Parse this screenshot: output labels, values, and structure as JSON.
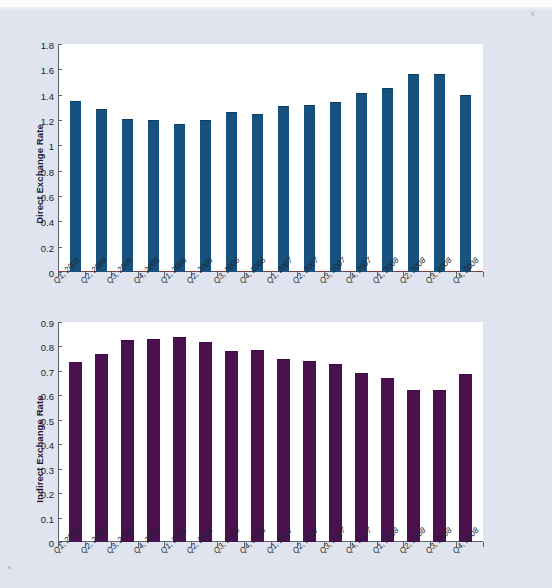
{
  "page": {
    "background_color": "#dfe4ef",
    "plot_background_color": "#ffffff"
  },
  "chart_data": [
    {
      "type": "bar",
      "title": "",
      "xlabel": "",
      "ylabel": "Direct Exchange Rate",
      "ylim": [
        0,
        1.8
      ],
      "ytick_step": 0.2,
      "yticks": [
        "1.8",
        "1.6",
        "1.4",
        "1.2",
        "1",
        "0.8",
        "0.6",
        "0.4",
        "0.2",
        "0"
      ],
      "grid": false,
      "legend": "none",
      "bar_color": "#17527e",
      "categories": [
        "Q1, 2005",
        "Q2, 2005",
        "Q3, 2005",
        "Q4, 2005",
        "Q1, 2006",
        "Q2, 2006",
        "Q3, 2006",
        "Q4, 2006",
        "Q1, 2007",
        "Q2, 2007",
        "Q3, 2007",
        "Q4, 2007",
        "Q1, 2008",
        "Q2, 2008",
        "Q3, 2008",
        "Q4, 2008"
      ],
      "values": [
        1.35,
        1.29,
        1.21,
        1.2,
        1.17,
        1.2,
        1.26,
        1.25,
        1.31,
        1.32,
        1.34,
        1.41,
        1.45,
        1.56,
        1.56,
        1.4
      ]
    },
    {
      "type": "bar",
      "title": "",
      "xlabel": "",
      "ylabel": "Indirect Exchange Rate",
      "ylim": [
        0,
        0.9
      ],
      "ytick_step": 0.1,
      "yticks": [
        "0.9",
        "0.8",
        "0.7",
        "0.6",
        "0.5",
        "0.4",
        "0.3",
        "0.2",
        "0.1",
        "0"
      ],
      "grid": false,
      "legend": "none",
      "bar_color": "#4a1050",
      "categories": [
        "Q1, 2005",
        "Q2, 2005",
        "Q3, 2005",
        "Q4, 2005",
        "Q1, 2006",
        "Q2, 2006",
        "Q3, 2006",
        "Q4, 2006",
        "Q1, 2007",
        "Q2, 2007",
        "Q3, 2007",
        "Q4, 2007",
        "Q1, 2008",
        "Q2, 2008",
        "Q3, 2008",
        "Q4, 2008"
      ],
      "values": [
        0.735,
        0.77,
        0.825,
        0.83,
        0.84,
        0.82,
        0.78,
        0.785,
        0.748,
        0.74,
        0.73,
        0.69,
        0.67,
        0.622,
        0.622,
        0.688
      ]
    }
  ]
}
